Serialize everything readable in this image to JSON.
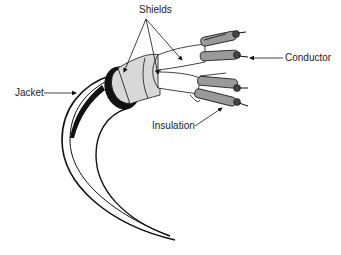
{
  "diagram": {
    "labels": {
      "shields": "Shields",
      "conductor": "Conductor",
      "jacket": "Jacket",
      "insulation": "Insulation"
    },
    "colors": {
      "background": "#ffffff",
      "outline": "#111111",
      "shield_fill": "#d8d8d8",
      "insulation_fill": "#9a9a9a",
      "conductor_fill": "#444444",
      "text": "#222222"
    },
    "components": [
      "Jacket",
      "Shields",
      "Insulation",
      "Conductor"
    ]
  }
}
